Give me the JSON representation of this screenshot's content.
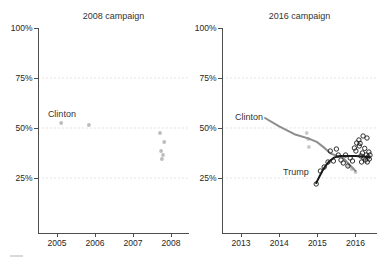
{
  "figure": {
    "background": "#ffffff",
    "axis_color": "#4d4d4d",
    "grid_color": "#d9d9d9",
    "y_tick_suffix": "%"
  },
  "chart_data": [
    {
      "type": "scatter",
      "title": "2008 campaign",
      "xlabel": "",
      "ylabel": "",
      "xlim": [
        2004.5,
        2008.5
      ],
      "ylim": [
        0,
        102.5
      ],
      "x_ticks": [
        2005,
        2006,
        2007,
        2008
      ],
      "y_ticks": [
        25,
        50,
        75,
        100
      ],
      "grid_y": [
        25,
        50,
        75
      ],
      "legend": "none",
      "series": [
        {
          "name": "Clinton polls",
          "kind": "scatter",
          "marker": "dot",
          "color": "#ababab",
          "points": [
            [
              2005.11,
              52.5
            ],
            [
              2005.84,
              51.5
            ],
            [
              2007.71,
              47.5
            ],
            [
              2007.82,
              43.0
            ],
            [
              2007.74,
              38.5
            ],
            [
              2007.79,
              36.5
            ],
            [
              2007.76,
              34.5
            ]
          ]
        }
      ],
      "annotations": [
        {
          "text": "Clinton",
          "x": 2004.76,
          "y": 57.0,
          "color": "#a8a8a8",
          "anchor": "start"
        }
      ]
    },
    {
      "type": "line",
      "title": "2016 campaign",
      "xlabel": "",
      "ylabel": "",
      "xlim": [
        2012.5,
        2016.6
      ],
      "ylim": [
        0,
        102.5
      ],
      "x_ticks": [
        2013,
        2014,
        2015,
        2016
      ],
      "y_ticks": [
        25,
        50,
        75,
        100
      ],
      "grid_y": [
        25,
        50,
        75
      ],
      "legend": "none",
      "series": [
        {
          "name": "Clinton polls",
          "kind": "scatter",
          "marker": "dot",
          "color": "#bdbdbd",
          "points": [
            [
              2014.72,
              47.5
            ],
            [
              2014.76,
              44.5
            ],
            [
              2014.78,
              40.5
            ],
            [
              2015.82,
              31.0
            ],
            [
              2015.9,
              29.5
            ],
            [
              2016.0,
              28.0
            ]
          ]
        },
        {
          "name": "Clinton trend",
          "kind": "line",
          "color": "#8c8c8c",
          "width": 2,
          "points": [
            [
              2013.63,
              55.0
            ],
            [
              2014.0,
              50.8
            ],
            [
              2014.4,
              46.9
            ],
            [
              2014.76,
              44.8
            ],
            [
              2015.0,
              42.9
            ],
            [
              2015.2,
              39.8
            ],
            [
              2015.35,
              37.2
            ],
            [
              2015.5,
              36.2
            ],
            [
              2015.65,
              35.5
            ],
            [
              2015.8,
              32.5
            ],
            [
              2016.0,
              28.5
            ]
          ]
        },
        {
          "name": "Trump trend",
          "kind": "line",
          "color": "#1a1a1a",
          "width": 2,
          "points": [
            [
              2014.97,
              22.5
            ],
            [
              2015.05,
              25.5
            ],
            [
              2015.13,
              28.5
            ],
            [
              2015.22,
              31.2
            ],
            [
              2015.32,
              33.5
            ],
            [
              2015.45,
              35.3
            ],
            [
              2015.6,
              36.0
            ],
            [
              2015.8,
              36.0
            ],
            [
              2016.0,
              36.0
            ],
            [
              2016.2,
              35.8
            ],
            [
              2016.36,
              35.4
            ]
          ]
        },
        {
          "name": "Trump polls",
          "kind": "scatter",
          "marker": "open-circle",
          "color": "#1a1a1a",
          "points": [
            [
              2014.97,
              22.0
            ],
            [
              2015.08,
              28.5
            ],
            [
              2015.18,
              30.5
            ],
            [
              2015.28,
              33.0
            ],
            [
              2015.34,
              38.5
            ],
            [
              2015.42,
              33.5
            ],
            [
              2015.5,
              39.5
            ],
            [
              2015.55,
              36.5
            ],
            [
              2015.62,
              34.0
            ],
            [
              2015.68,
              32.5
            ],
            [
              2015.74,
              36.5
            ],
            [
              2015.8,
              31.0
            ],
            [
              2015.86,
              35.0
            ],
            [
              2015.92,
              33.5
            ],
            [
              2015.97,
              40.0
            ],
            [
              2016.01,
              38.5
            ],
            [
              2016.03,
              42.5
            ],
            [
              2016.09,
              44.0
            ],
            [
              2016.1,
              41.0
            ],
            [
              2016.12,
              42.3
            ],
            [
              2016.14,
              36.0
            ],
            [
              2016.16,
              33.0
            ],
            [
              2016.18,
              37.5
            ],
            [
              2016.2,
              46.0
            ],
            [
              2016.22,
              35.0
            ],
            [
              2016.24,
              39.8
            ],
            [
              2016.26,
              34.0
            ],
            [
              2016.28,
              36.5
            ],
            [
              2016.3,
              45.0
            ],
            [
              2016.31,
              33.0
            ],
            [
              2016.33,
              35.5
            ],
            [
              2016.35,
              38.0
            ],
            [
              2016.36,
              34.5
            ],
            [
              2016.38,
              36.5
            ]
          ]
        }
      ],
      "annotations": [
        {
          "text": "Clinton",
          "x": 2012.84,
          "y": 55.3,
          "color": "#999999",
          "anchor": "start"
        },
        {
          "text": "Trump",
          "x": 2014.1,
          "y": 27.8,
          "color": "#1a1a1a",
          "anchor": "start"
        }
      ]
    }
  ]
}
